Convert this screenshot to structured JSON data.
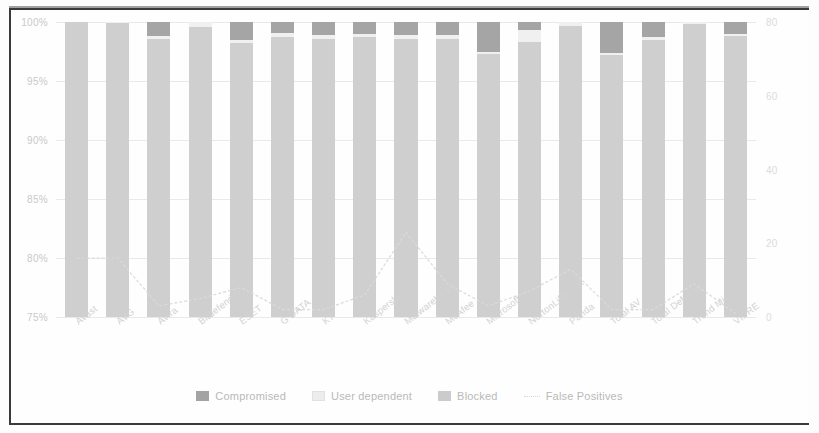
{
  "chart_data": {
    "type": "bar",
    "title": "",
    "xlabel": "",
    "ylabel": "",
    "ylim": [
      75,
      100
    ],
    "y2lim": [
      0,
      80
    ],
    "grid": true,
    "legend_position": "bottom",
    "categories": [
      "Avast",
      "AVG",
      "Avira",
      "Bitdefender",
      "ESET",
      "G DATA",
      "K7",
      "Kaspersky",
      "Malwarebytes",
      "McAfee",
      "Microsoft",
      "NortonLifeLock",
      "Panda",
      "Total AV",
      "Total Defense",
      "Trend Micro",
      "VIPRE"
    ],
    "ytick_labels": [
      "100%",
      "95%",
      "90%",
      "85%",
      "80%",
      "75%"
    ],
    "ytick_values": [
      100,
      95,
      90,
      85,
      80,
      75
    ],
    "y2tick_labels": [
      "80",
      "60",
      "40",
      "20",
      "0"
    ],
    "y2tick_values": [
      80,
      60,
      40,
      20,
      0
    ],
    "series": [
      {
        "name": "Blocked",
        "color": "#cfcfcf",
        "values": [
          100,
          99.9,
          98.6,
          99.6,
          98.2,
          98.7,
          98.6,
          98.7,
          98.6,
          98.6,
          97.3,
          98.3,
          99.7,
          97.2,
          98.5,
          99.8,
          98.8
        ]
      },
      {
        "name": "User dependent",
        "color": "#f0f0f0",
        "values": [
          0,
          0.1,
          0.2,
          0.4,
          0.3,
          0.4,
          0.3,
          0.3,
          0.3,
          0.3,
          0.2,
          1.0,
          0.3,
          0.2,
          0.2,
          0.2,
          0.2
        ]
      },
      {
        "name": "Compromised",
        "color": "#a5a5a5",
        "values": [
          0,
          0,
          1.2,
          0,
          1.5,
          0.9,
          1.1,
          1.0,
          1.1,
          1.1,
          2.5,
          0.7,
          0,
          2.6,
          1.3,
          0,
          1.0
        ]
      }
    ],
    "fp_series": {
      "name": "False Positives",
      "color": "#d8d8d8",
      "axis": "right",
      "values": [
        16,
        16,
        3,
        5,
        8,
        2,
        2,
        6,
        23,
        9,
        3,
        7,
        13,
        2,
        2,
        9,
        1
      ]
    }
  },
  "legend": {
    "items": [
      {
        "label": "Compromised",
        "swatch": "compromised-swatch"
      },
      {
        "label": "User dependent",
        "swatch": "user-dependent-swatch"
      },
      {
        "label": "Blocked",
        "swatch": "blocked-swatch"
      },
      {
        "label": "False Positives",
        "swatch": "false-positives-line-swatch"
      }
    ]
  }
}
